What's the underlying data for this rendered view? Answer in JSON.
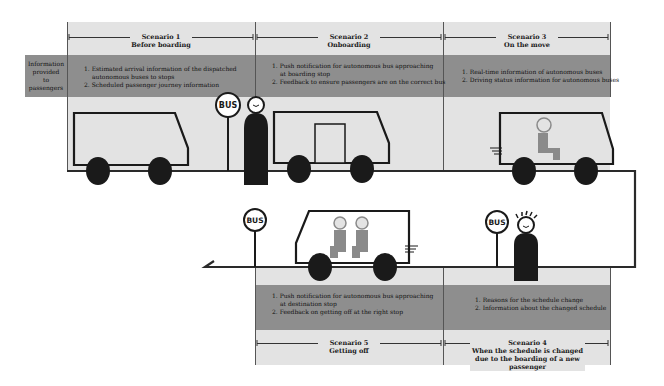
{
  "row_label": "Information provided to passengers",
  "row_label_lines": [
    "Information",
    "provided",
    "to passengers"
  ],
  "scenarios": [
    {
      "title": "Scenario 1",
      "subtitle": "Before boarding",
      "items": [
        "1. Estimated arrival information of the dispatched",
        "autonomous buses to stops",
        "2. Scheduled passenger journey information"
      ]
    },
    {
      "title": "Scenario 2",
      "subtitle": "Onboarding",
      "items": [
        "1. Push notification for autonomous bus approaching",
        "at boarding stop",
        "2. Feedback to ensure passengers are on the correct bus"
      ]
    },
    {
      "title": "Scenario 3",
      "subtitle": "On the move",
      "items": [
        "1. Real-time information of autonomous buses",
        "2. Driving status information for autonomous buses"
      ]
    },
    {
      "title": "Scenario 4",
      "subtitle_lines": [
        "When the schedule is changed",
        "due to the boarding of a new passenger"
      ],
      "items": [
        "1. Reasons for the schedule change",
        "2. Information about the changed schedule"
      ]
    },
    {
      "title": "Scenario 5",
      "subtitle": "Getting off",
      "items": [
        "1. Push notification for autonomous bus approaching",
        "at destination stop",
        "2. Feedback on getting off at the right stop"
      ]
    }
  ],
  "bus_stop_sign": "BUS",
  "colors": {
    "light_band": "#e3e3e3",
    "dark_band": "#8e8e8e",
    "ink": "#1a1a1a",
    "passenger": "#8a8a8a"
  }
}
